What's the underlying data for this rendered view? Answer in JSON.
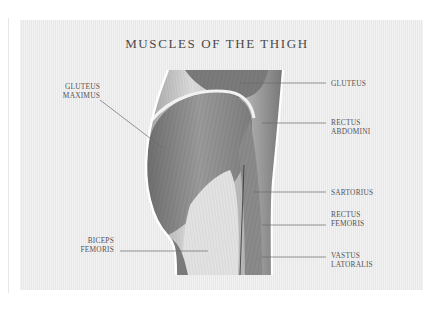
{
  "title": "MUSCLES OF THE THIGH",
  "labels_left": [
    {
      "line1": "GLUTEUS",
      "line2": "MAXIMUS"
    },
    {
      "line1": "BICEPS",
      "line2": "FEMORIS"
    }
  ],
  "labels_right": [
    {
      "line1": "GLUTEUS",
      "line2": ""
    },
    {
      "line1": "RECTUS",
      "line2": "ABDOMINI"
    },
    {
      "line1": "SARTORIUS",
      "line2": ""
    },
    {
      "line1": "RECTUS",
      "line2": "FEMORIS"
    },
    {
      "line1": "VASTUS",
      "line2": "LATORALIS"
    }
  ],
  "colors": {
    "panel": "#ececec",
    "text": "#555555",
    "leader_line": "#6a6a6a",
    "outline": "#ffffff"
  }
}
